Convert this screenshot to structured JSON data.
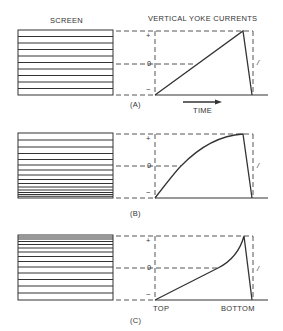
{
  "titles": {
    "screen": "SCREEN",
    "currents": "VERTICAL YOKE CURRENTS"
  },
  "panels": [
    {
      "id": "A",
      "label": "(A)",
      "waveform": "linear",
      "line_spacing": "uniform"
    },
    {
      "id": "B",
      "label": "(B)",
      "waveform": "concave-down",
      "line_spacing": "compressed-at-bottom"
    },
    {
      "id": "C",
      "label": "(C)",
      "waveform": "concave-up",
      "line_spacing": "compressed-at-top"
    }
  ],
  "axis": {
    "plus": "+",
    "zero": "0",
    "minus": "−",
    "retrace": "/"
  },
  "annotations": {
    "time": "TIME",
    "top": "TOP",
    "bottom": "BOTTOM"
  },
  "colors": {
    "line": "#333333",
    "dash": "#555555",
    "background": "#ffffff"
  }
}
